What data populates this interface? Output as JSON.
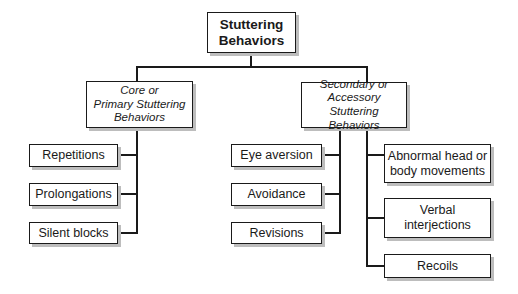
{
  "colors": {
    "background": "#ffffff",
    "box_border": "#1a1a1a",
    "box_shadow": "#bdbdbd",
    "connector": "#1a1a1a",
    "text": "#1a1a1a"
  },
  "diagram": {
    "root": {
      "label": "Stuttering\nBehaviors"
    },
    "primary": {
      "label": "Core or\nPrimary Stuttering\nBehaviors",
      "children": [
        "Repetitions",
        "Prolongations",
        "Silent blocks"
      ]
    },
    "secondary": {
      "label": "Secondary or\nAccessory Stuttering\nBehaviors",
      "children_left": [
        "Eye aversion",
        "Avoidance",
        "Revisions"
      ],
      "children_right": [
        "Abnormal head or\nbody movements",
        "Verbal\ninterjections",
        "Recoils"
      ]
    }
  }
}
